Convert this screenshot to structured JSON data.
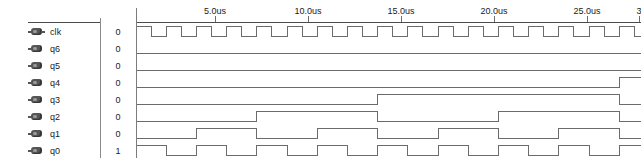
{
  "window": {
    "title": "Waveform Viewer",
    "background": "#ffffff",
    "wave_color": "#6b6b6b",
    "text_color": "#1a1a1a",
    "rule_color": "#4c4c4c",
    "cursor_color": "#7c7c7c"
  },
  "signals": [
    {
      "name": "clk",
      "value": "0",
      "icon": "signal-pin-io-icon",
      "kind": "clock",
      "divider": 1
    },
    {
      "name": "q6",
      "value": "0",
      "icon": "signal-pin-out-icon",
      "kind": "counter",
      "divider": 128
    },
    {
      "name": "q5",
      "value": "0",
      "icon": "signal-pin-out-icon",
      "kind": "counter",
      "divider": 64
    },
    {
      "name": "q4",
      "value": "0",
      "icon": "signal-pin-out-icon",
      "kind": "counter",
      "divider": 32
    },
    {
      "name": "q3",
      "value": "0",
      "icon": "signal-pin-out-icon",
      "kind": "counter",
      "divider": 16
    },
    {
      "name": "q2",
      "value": "0",
      "icon": "signal-pin-out-icon",
      "kind": "counter",
      "divider": 8
    },
    {
      "name": "q1",
      "value": "0",
      "icon": "signal-pin-out-icon",
      "kind": "counter",
      "divider": 4
    },
    {
      "name": "q0",
      "value": "1",
      "icon": "signal-pin-out-icon",
      "kind": "counter",
      "divider": 2
    }
  ],
  "time_axis": {
    "unit": "us",
    "ticks": [
      {
        "label": "5.0us",
        "time": 5.0,
        "x": 79
      },
      {
        "label": "10.0us",
        "time": 10.0,
        "x": 172
      },
      {
        "label": "15.0us",
        "time": 15.0,
        "x": 265
      },
      {
        "label": "20.0us",
        "time": 20.0,
        "x": 358
      },
      {
        "label": "25.0us",
        "time": 25.0,
        "x": 451
      },
      {
        "label": "3",
        "time": 30.0,
        "x": 503
      }
    ],
    "start_time": 0.75,
    "pixels_per_us": 18.6,
    "cursor_time": 0.75
  },
  "waveform": {
    "clock_period_px": 30.2,
    "clock_start_level": 1,
    "row_height": 17,
    "first_row_top": 23
  }
}
